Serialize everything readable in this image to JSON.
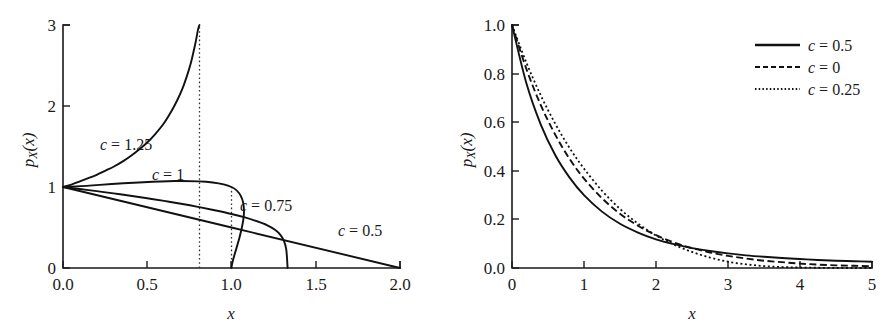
{
  "figure": {
    "background": "#ffffff",
    "ink_color": "#111111",
    "panels": 2
  },
  "chart_data": [
    {
      "id": "left-panel",
      "type": "line",
      "title": "",
      "xlabel": "x",
      "ylabel": "p_X(x)",
      "xlim": [
        0.0,
        2.0
      ],
      "ylim": [
        0,
        3
      ],
      "xticks": [
        0.0,
        0.5,
        1.0,
        1.5,
        2.0
      ],
      "xticklabels": [
        "0.0",
        "0.5",
        "1.0",
        "1.5",
        "2.0"
      ],
      "yticks": [
        0,
        1,
        2,
        3
      ],
      "yticklabels": [
        "0",
        "1",
        "2",
        "3"
      ],
      "grid": false,
      "legend": "none",
      "annotations": [
        {
          "text": "c = 1.25",
          "x": 0.62,
          "y": 1.48
        },
        {
          "text": "c = 1",
          "x": 0.88,
          "y": 1.18
        },
        {
          "text": "c = 0.75",
          "x": 1.22,
          "y": 0.78
        },
        {
          "text": "c = 0.5",
          "x": 1.72,
          "y": 0.52
        }
      ],
      "guides": [
        {
          "kind": "vertical-dotted",
          "x": 0.81,
          "y_from": 0.0,
          "y_to": 3.0
        },
        {
          "kind": "vertical-dotted",
          "x": 1.0,
          "y_from": 0.0,
          "y_to": 1.0
        }
      ],
      "series": [
        {
          "name": "c = 1.25",
          "style": "solid",
          "label": "c = 1.25",
          "x": [
            0.0,
            0.05,
            0.1,
            0.15,
            0.2,
            0.25,
            0.3,
            0.35,
            0.4,
            0.45,
            0.5,
            0.55,
            0.6,
            0.65,
            0.68,
            0.71,
            0.74,
            0.76,
            0.78,
            0.79,
            0.8,
            0.805,
            0.808,
            0.81
          ],
          "values": [
            1.0,
            1.03,
            1.07,
            1.11,
            1.15,
            1.2,
            1.25,
            1.31,
            1.38,
            1.46,
            1.55,
            1.66,
            1.79,
            1.96,
            2.08,
            2.22,
            2.4,
            2.54,
            2.72,
            2.82,
            2.93,
            2.97,
            2.99,
            3.0
          ]
        },
        {
          "name": "c = 1",
          "style": "solid",
          "label": "c = 1",
          "x": [
            0.0,
            1.0,
            1.0
          ],
          "values": [
            1.0,
            1.0,
            0.0
          ]
        },
        {
          "name": "c = 0.75",
          "style": "solid",
          "label": "c = 0.75",
          "x": [
            0.0,
            0.1,
            0.2,
            0.3,
            0.4,
            0.5,
            0.6,
            0.7,
            0.8,
            0.9,
            1.0,
            1.08,
            1.15,
            1.21,
            1.26,
            1.29,
            1.31,
            1.325,
            1.333
          ],
          "values": [
            1.0,
            0.975,
            0.949,
            0.921,
            0.892,
            0.861,
            0.828,
            0.793,
            0.755,
            0.713,
            0.667,
            0.624,
            0.578,
            0.53,
            0.47,
            0.41,
            0.34,
            0.23,
            0.0
          ]
        },
        {
          "name": "c = 0.5",
          "style": "solid",
          "label": "c = 0.5",
          "x": [
            0.0,
            2.0
          ],
          "values": [
            1.0,
            0.0
          ]
        }
      ]
    },
    {
      "id": "right-panel",
      "type": "line",
      "title": "",
      "xlabel": "x",
      "ylabel": "p_X(x)",
      "xlim": [
        0,
        5
      ],
      "ylim": [
        0.0,
        1.0
      ],
      "xticks": [
        0,
        1,
        2,
        3,
        4,
        5
      ],
      "xticklabels": [
        "0",
        "1",
        "2",
        "3",
        "4",
        "5"
      ],
      "yticks": [
        0.0,
        0.2,
        0.4,
        0.6,
        0.8,
        1.0
      ],
      "yticklabels": [
        "0.0",
        "0.2",
        "0.4",
        "0.6",
        "0.8",
        "1.0"
      ],
      "grid": false,
      "legend": "upper right",
      "legend_entries": [
        {
          "label": "c = 0.5",
          "style": "solid"
        },
        {
          "label": "c = 0",
          "style": "dashed"
        },
        {
          "label": "c = 0.25",
          "style": "dotted"
        }
      ],
      "series": [
        {
          "name": "c = 0.5",
          "style": "solid",
          "label": "c = 0.5",
          "x": [
            0.0,
            0.2,
            0.4,
            0.6,
            0.8,
            1.0,
            1.25,
            1.5,
            1.75,
            2.0,
            2.25,
            2.5,
            2.75,
            3.0,
            3.25,
            3.5,
            3.75,
            4.0,
            4.25,
            4.5,
            4.75,
            5.0
          ],
          "values": [
            1.0,
            0.76,
            0.59,
            0.465,
            0.372,
            0.3,
            0.232,
            0.182,
            0.146,
            0.118,
            0.098,
            0.082,
            0.07,
            0.06,
            0.052,
            0.046,
            0.041,
            0.037,
            0.033,
            0.03,
            0.028,
            0.026
          ]
        },
        {
          "name": "c = 0",
          "style": "dashed",
          "label": "c = 0",
          "x": [
            0.0,
            0.2,
            0.4,
            0.6,
            0.8,
            1.0,
            1.25,
            1.5,
            1.75,
            2.0,
            2.25,
            2.5,
            2.75,
            3.0,
            3.25,
            3.5,
            3.75,
            4.0,
            4.25,
            4.5,
            4.75,
            5.0
          ],
          "values": [
            1.0,
            0.819,
            0.67,
            0.549,
            0.449,
            0.368,
            0.287,
            0.223,
            0.174,
            0.135,
            0.105,
            0.082,
            0.064,
            0.05,
            0.039,
            0.03,
            0.024,
            0.018,
            0.014,
            0.011,
            0.009,
            0.007
          ]
        },
        {
          "name": "c = 0.25",
          "style": "dotted",
          "label": "c = 0.25",
          "x": [
            0.0,
            0.2,
            0.4,
            0.6,
            0.8,
            1.0,
            1.25,
            1.5,
            1.75,
            2.0,
            2.25,
            2.5,
            2.75,
            3.0,
            3.25,
            3.5,
            3.75,
            4.0,
            4.25,
            4.5,
            4.75,
            5.0
          ],
          "values": [
            1.0,
            0.845,
            0.71,
            0.594,
            0.494,
            0.409,
            0.318,
            0.243,
            0.183,
            0.134,
            0.096,
            0.066,
            0.043,
            0.026,
            0.015,
            0.008,
            0.004,
            0.002,
            0.001,
            0.0,
            0.0,
            0.0
          ]
        }
      ]
    }
  ],
  "left": {
    "ylabel": "p",
    "ylabel_sub": "X",
    "ylabel_arg": "(x)",
    "xlabel": "x",
    "yticks": [
      "3",
      "2",
      "1",
      "0"
    ],
    "xticks": [
      "0.0",
      "0.5",
      "1.0",
      "1.5",
      "2.0"
    ],
    "labels": {
      "c125": "c = 1.25",
      "c1": "c = 1",
      "c075": "c = 0.75",
      "c05": "c = 0.5"
    }
  },
  "right": {
    "ylabel": "p",
    "ylabel_sub": "X",
    "ylabel_arg": "(x)",
    "xlabel": "x",
    "yticks": [
      "1.0",
      "0.8",
      "0.6",
      "0.4",
      "0.2",
      "0.0"
    ],
    "xticks": [
      "0",
      "1",
      "2",
      "3",
      "4",
      "5"
    ],
    "legend": {
      "item1": "c = 0.5",
      "item2": "c = 0",
      "item3": "c = 0.25"
    }
  }
}
